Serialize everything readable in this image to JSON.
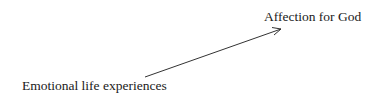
{
  "diagram": {
    "nodes": [
      {
        "id": "source",
        "label": "Emotional life experiences"
      },
      {
        "id": "target",
        "label": "Affection for God"
      }
    ],
    "edges": [
      {
        "from": "source",
        "to": "target",
        "type": "directed-arrow"
      }
    ],
    "colors": {
      "text": "#1a1a1a",
      "line": "#333333",
      "background": "#ffffff"
    }
  }
}
